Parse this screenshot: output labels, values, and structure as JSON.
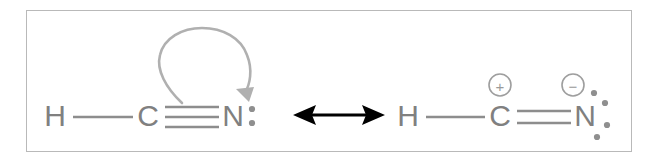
{
  "figure": {
    "background_color": "#ffffff",
    "frame_color": "#b9b9b9",
    "atom_color": "#808080",
    "bond_color": "#8d8d8d",
    "curly_arrow_color": "#b0b0b0",
    "resonance_arrow_color": "#000000"
  },
  "structures": [
    {
      "id": "left-structure",
      "name": "hydrogen-cyanide-neutral",
      "atoms": [
        {
          "id": "left-h",
          "label": "H",
          "x": 55,
          "y": 125
        },
        {
          "id": "left-c",
          "label": "C",
          "x": 148,
          "y": 125
        },
        {
          "id": "left-n",
          "label": "N",
          "x": 233,
          "y": 125
        }
      ],
      "bonds": [
        {
          "id": "left-hc-bond",
          "from": "H",
          "to": "C",
          "order": 1,
          "label": "single"
        },
        {
          "id": "left-cn-bond",
          "from": "C",
          "to": "N",
          "order": 3,
          "label": "triple"
        }
      ],
      "lone_pairs": [
        {
          "id": "left-n-lone-pair",
          "on": "N",
          "orientation": "vertical",
          "dots": 2
        }
      ],
      "charges": [],
      "curly_arrow": {
        "id": "electron-pushing-arrow",
        "from": "C-N pi bond",
        "to": "N lone pair region",
        "direction": "counterclockwise-loop",
        "color": "#b0b0b0"
      }
    },
    {
      "id": "right-structure",
      "name": "hydrogen-cyanide-zwitterion",
      "atoms": [
        {
          "id": "right-h",
          "label": "H",
          "x": 408,
          "y": 125
        },
        {
          "id": "right-c",
          "label": "C",
          "x": 500,
          "y": 125
        },
        {
          "id": "right-n",
          "label": "N",
          "x": 585,
          "y": 125
        }
      ],
      "bonds": [
        {
          "id": "right-hc-bond",
          "from": "H",
          "to": "C",
          "order": 1,
          "label": "single"
        },
        {
          "id": "right-cn-bond",
          "from": "C",
          "to": "N",
          "order": 2,
          "label": "double"
        }
      ],
      "lone_pairs": [
        {
          "id": "right-n-lone-pair-upper",
          "on": "N",
          "orientation": "diagonal-upper-right",
          "dots": 2
        },
        {
          "id": "right-n-lone-pair-lower",
          "on": "N",
          "orientation": "diagonal-lower-right",
          "dots": 2
        }
      ],
      "charges": [
        {
          "id": "carbon-positive-charge",
          "on": "C",
          "sign": "+",
          "symbol": "⊕",
          "x": 500,
          "y": 85
        },
        {
          "id": "nitrogen-negative-charge",
          "on": "N",
          "sign": "−",
          "symbol": "⊖",
          "x": 573,
          "y": 85
        }
      ],
      "curly_arrow": null
    }
  ],
  "resonance_arrow": {
    "id": "resonance-double-arrow",
    "symbol": "↔",
    "meaning": "resonance",
    "double_headed": true,
    "x_start": 293,
    "x_end": 385,
    "y": 115,
    "color": "#000000"
  }
}
